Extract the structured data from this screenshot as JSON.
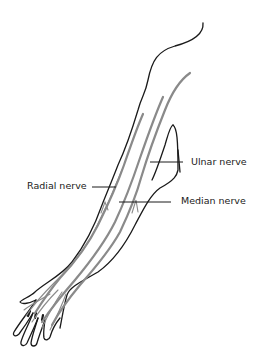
{
  "diagram": {
    "labels": {
      "ulnar": "Ulnar nerve",
      "radial": "Radial nerve",
      "median": "Median nerve"
    },
    "colors": {
      "outline": "#1a1a1a",
      "nerve": "#8a8a8a",
      "background": "#ffffff"
    }
  }
}
